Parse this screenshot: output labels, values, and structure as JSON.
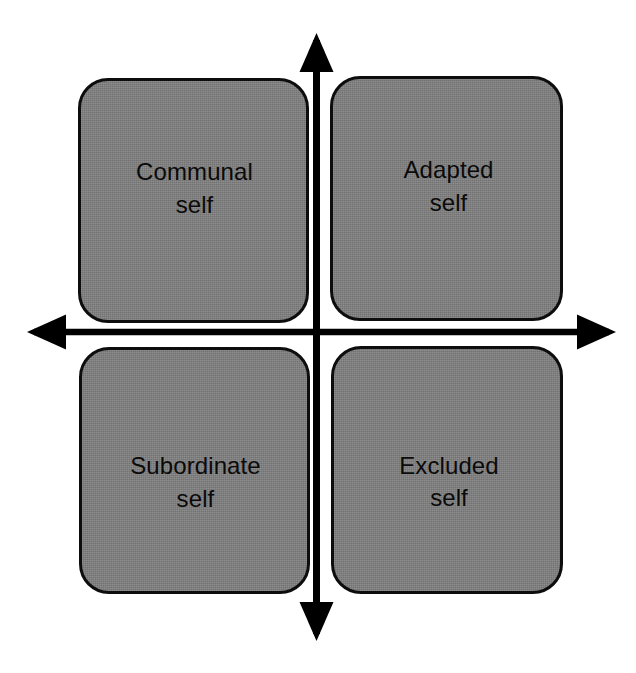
{
  "diagram": {
    "type": "2x2-quadrant-matrix",
    "background_color": "#ffffff",
    "box_fill_color": "#808080",
    "box_border_color": "#0d0d0d",
    "axis_color": "#000000",
    "label_color": "#0a0a0a",
    "axes": {
      "vertical": {
        "name": "vertical-axis",
        "arrowheads": "both",
        "top_arrow_label": "",
        "bottom_arrow_label": "",
        "label": ""
      },
      "horizontal": {
        "name": "horizontal-axis",
        "arrowheads": "both",
        "left_arrow_label": "",
        "right_arrow_label": "",
        "label": ""
      }
    },
    "quadrants": [
      {
        "id": "top-left",
        "position": "upper-left",
        "line1": "Communal",
        "line2": "self",
        "text": "Communal\nself"
      },
      {
        "id": "top-right",
        "position": "upper-right",
        "line1": "Adapted",
        "line2": "self",
        "text": "Adapted\nself"
      },
      {
        "id": "bottom-left",
        "position": "lower-left",
        "line1": "Subordinate",
        "line2": "self",
        "text": "Subordinate\nself"
      },
      {
        "id": "bottom-right",
        "position": "lower-right",
        "line1": "Excluded",
        "line2": "self",
        "text": "Excluded\nself"
      }
    ]
  }
}
